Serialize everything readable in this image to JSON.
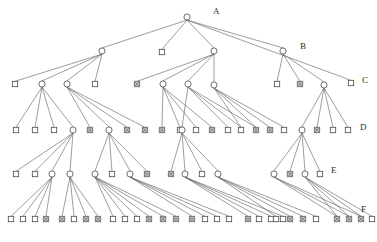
{
  "figure": {
    "caption": "",
    "level_labels": [
      {
        "text": "A",
        "x": 213,
        "y": 6
      },
      {
        "text": "B",
        "x": 300,
        "y": 41
      },
      {
        "text": "C",
        "x": 362,
        "y": 75
      },
      {
        "text": "D",
        "x": 360,
        "y": 122
      },
      {
        "text": "E",
        "x": 331,
        "y": 165
      },
      {
        "text": "F",
        "x": 361,
        "y": 204
      }
    ],
    "colors": {
      "edge": "#5d5d5d",
      "node_stroke": "#4a4a4a",
      "node_fill": "#ffffff",
      "marked_fill": "#8a8a8a",
      "text": "#2b2b2b",
      "background": "#ffffff"
    },
    "legend_note": "circle = internal node, square = leaf node, crossed square = marked leaf"
  },
  "chart_data": {
    "type": "diagram",
    "title": "",
    "rows": [
      "A",
      "B",
      "C",
      "D",
      "E",
      "F"
    ],
    "row_y": [
      17,
      51,
      84,
      130,
      174,
      219
    ],
    "nodes": [
      {
        "id": "A0",
        "row": 0,
        "x": 187,
        "y": 17,
        "shape": "circle",
        "marked": false
      },
      {
        "id": "B0",
        "row": 1,
        "x": 102,
        "y": 51,
        "shape": "circle",
        "marked": false
      },
      {
        "id": "B1",
        "row": 1,
        "x": 162,
        "y": 52,
        "shape": "square",
        "marked": false
      },
      {
        "id": "B2",
        "row": 1,
        "x": 214,
        "y": 51,
        "shape": "circle",
        "marked": false
      },
      {
        "id": "B3",
        "row": 1,
        "x": 283,
        "y": 51,
        "shape": "circle",
        "marked": false
      },
      {
        "id": "C0",
        "row": 2,
        "x": 15,
        "y": 84,
        "shape": "square",
        "marked": false
      },
      {
        "id": "C1",
        "row": 2,
        "x": 42,
        "y": 84,
        "shape": "circle",
        "marked": false
      },
      {
        "id": "C2",
        "row": 2,
        "x": 67,
        "y": 84,
        "shape": "circle",
        "marked": false
      },
      {
        "id": "C3",
        "row": 2,
        "x": 95,
        "y": 84,
        "shape": "square",
        "marked": false
      },
      {
        "id": "C4",
        "row": 2,
        "x": 137,
        "y": 84,
        "shape": "square",
        "marked": true
      },
      {
        "id": "C5",
        "row": 2,
        "x": 163,
        "y": 84,
        "shape": "circle",
        "marked": false
      },
      {
        "id": "C6",
        "row": 2,
        "x": 188,
        "y": 84,
        "shape": "circle",
        "marked": false
      },
      {
        "id": "C7",
        "row": 2,
        "x": 214,
        "y": 85,
        "shape": "circle",
        "marked": false
      },
      {
        "id": "C8",
        "row": 2,
        "x": 277,
        "y": 84,
        "shape": "square",
        "marked": false
      },
      {
        "id": "C9",
        "row": 2,
        "x": 300,
        "y": 84,
        "shape": "square",
        "marked": true
      },
      {
        "id": "C10",
        "row": 2,
        "x": 324,
        "y": 85,
        "shape": "circle",
        "marked": false
      },
      {
        "id": "C11",
        "row": 2,
        "x": 351,
        "y": 83,
        "shape": "square",
        "marked": false
      },
      {
        "id": "D0",
        "row": 3,
        "x": 16,
        "y": 130,
        "shape": "square",
        "marked": false
      },
      {
        "id": "D1",
        "row": 3,
        "x": 35,
        "y": 130,
        "shape": "square",
        "marked": false
      },
      {
        "id": "D2",
        "row": 3,
        "x": 54,
        "y": 130,
        "shape": "square",
        "marked": false
      },
      {
        "id": "D3",
        "row": 3,
        "x": 73,
        "y": 130,
        "shape": "circle",
        "marked": false
      },
      {
        "id": "D4",
        "row": 3,
        "x": 90,
        "y": 130,
        "shape": "square",
        "marked": true
      },
      {
        "id": "D5",
        "row": 3,
        "x": 109,
        "y": 130,
        "shape": "circle",
        "marked": false
      },
      {
        "id": "D6",
        "row": 3,
        "x": 127,
        "y": 130,
        "shape": "square",
        "marked": true
      },
      {
        "id": "D7",
        "row": 3,
        "x": 145,
        "y": 130,
        "shape": "square",
        "marked": true
      },
      {
        "id": "D8",
        "row": 3,
        "x": 162,
        "y": 130,
        "shape": "square",
        "marked": true
      },
      {
        "id": "D9",
        "row": 3,
        "x": 180,
        "y": 130,
        "shape": "square",
        "marked": false
      },
      {
        "id": "D10",
        "row": 3,
        "x": 196,
        "y": 130,
        "shape": "square",
        "marked": false
      },
      {
        "id": "D11",
        "row": 3,
        "x": 212,
        "y": 130,
        "shape": "square",
        "marked": true
      },
      {
        "id": "D12",
        "row": 3,
        "x": 182,
        "y": 130,
        "shape": "circle",
        "marked": false
      },
      {
        "id": "D13",
        "row": 3,
        "x": 228,
        "y": 130,
        "shape": "square",
        "marked": false
      },
      {
        "id": "D14",
        "row": 3,
        "x": 241,
        "y": 130,
        "shape": "square",
        "marked": false
      },
      {
        "id": "D15",
        "row": 3,
        "x": 256,
        "y": 130,
        "shape": "square",
        "marked": true
      },
      {
        "id": "D16",
        "row": 3,
        "x": 270,
        "y": 130,
        "shape": "square",
        "marked": true
      },
      {
        "id": "D17",
        "row": 3,
        "x": 284,
        "y": 130,
        "shape": "square",
        "marked": false
      },
      {
        "id": "D18",
        "row": 3,
        "x": 302,
        "y": 130,
        "shape": "circle",
        "marked": false
      },
      {
        "id": "D19",
        "row": 3,
        "x": 317,
        "y": 130,
        "shape": "square",
        "marked": true
      },
      {
        "id": "D20",
        "row": 3,
        "x": 333,
        "y": 130,
        "shape": "square",
        "marked": false
      },
      {
        "id": "D21",
        "row": 3,
        "x": 348,
        "y": 130,
        "shape": "square",
        "marked": false
      },
      {
        "id": "E0",
        "row": 4,
        "x": 16,
        "y": 174,
        "shape": "square",
        "marked": false
      },
      {
        "id": "E1",
        "row": 4,
        "x": 35,
        "y": 174,
        "shape": "square",
        "marked": false
      },
      {
        "id": "E2",
        "row": 4,
        "x": 52,
        "y": 174,
        "shape": "circle",
        "marked": false
      },
      {
        "id": "E3",
        "row": 4,
        "x": 70,
        "y": 174,
        "shape": "circle",
        "marked": false
      },
      {
        "id": "E4",
        "row": 4,
        "x": 95,
        "y": 174,
        "shape": "circle",
        "marked": false
      },
      {
        "id": "E5",
        "row": 4,
        "x": 112,
        "y": 174,
        "shape": "square",
        "marked": false
      },
      {
        "id": "E6",
        "row": 4,
        "x": 130,
        "y": 174,
        "shape": "circle",
        "marked": false
      },
      {
        "id": "E7",
        "row": 4,
        "x": 147,
        "y": 174,
        "shape": "square",
        "marked": true
      },
      {
        "id": "E8",
        "row": 4,
        "x": 171,
        "y": 174,
        "shape": "square",
        "marked": true
      },
      {
        "id": "E9",
        "row": 4,
        "x": 185,
        "y": 174,
        "shape": "circle",
        "marked": false
      },
      {
        "id": "E10",
        "row": 4,
        "x": 202,
        "y": 174,
        "shape": "square",
        "marked": false
      },
      {
        "id": "E11",
        "row": 4,
        "x": 218,
        "y": 174,
        "shape": "circle",
        "marked": false
      },
      {
        "id": "E12",
        "row": 4,
        "x": 274,
        "y": 174,
        "shape": "circle",
        "marked": false
      },
      {
        "id": "E13",
        "row": 4,
        "x": 290,
        "y": 174,
        "shape": "square",
        "marked": true
      },
      {
        "id": "E14",
        "row": 4,
        "x": 305,
        "y": 174,
        "shape": "circle",
        "marked": false
      },
      {
        "id": "E15",
        "row": 4,
        "x": 320,
        "y": 174,
        "shape": "square",
        "marked": false
      },
      {
        "id": "F0",
        "row": 5,
        "x": 11,
        "y": 219,
        "shape": "square",
        "marked": false
      },
      {
        "id": "F1",
        "row": 5,
        "x": 23,
        "y": 219,
        "shape": "square",
        "marked": false
      },
      {
        "id": "F2",
        "row": 5,
        "x": 35,
        "y": 219,
        "shape": "square",
        "marked": false
      },
      {
        "id": "F3",
        "row": 5,
        "x": 46,
        "y": 219,
        "shape": "square",
        "marked": true
      },
      {
        "id": "F4",
        "row": 5,
        "x": 62,
        "y": 219,
        "shape": "square",
        "marked": true
      },
      {
        "id": "F5",
        "row": 5,
        "x": 74,
        "y": 219,
        "shape": "square",
        "marked": false
      },
      {
        "id": "F6",
        "row": 5,
        "x": 86,
        "y": 219,
        "shape": "square",
        "marked": true
      },
      {
        "id": "F7",
        "row": 5,
        "x": 98,
        "y": 219,
        "shape": "square",
        "marked": true
      },
      {
        "id": "F8",
        "row": 5,
        "x": 113,
        "y": 219,
        "shape": "square",
        "marked": false
      },
      {
        "id": "F9",
        "row": 5,
        "x": 125,
        "y": 219,
        "shape": "square",
        "marked": false
      },
      {
        "id": "F10",
        "row": 5,
        "x": 137,
        "y": 219,
        "shape": "square",
        "marked": false
      },
      {
        "id": "F11",
        "row": 5,
        "x": 149,
        "y": 219,
        "shape": "square",
        "marked": true
      },
      {
        "id": "F12",
        "row": 5,
        "x": 163,
        "y": 219,
        "shape": "square",
        "marked": true
      },
      {
        "id": "F13",
        "row": 5,
        "x": 176,
        "y": 219,
        "shape": "square",
        "marked": true
      },
      {
        "id": "F14",
        "row": 5,
        "x": 192,
        "y": 219,
        "shape": "square",
        "marked": true
      },
      {
        "id": "F15",
        "row": 5,
        "x": 205,
        "y": 219,
        "shape": "square",
        "marked": false
      },
      {
        "id": "F16",
        "row": 5,
        "x": 217,
        "y": 219,
        "shape": "square",
        "marked": false
      },
      {
        "id": "F17",
        "row": 5,
        "x": 229,
        "y": 219,
        "shape": "square",
        "marked": false
      },
      {
        "id": "F18",
        "row": 5,
        "x": 248,
        "y": 219,
        "shape": "square",
        "marked": true
      },
      {
        "id": "F19",
        "row": 5,
        "x": 259,
        "y": 219,
        "shape": "square",
        "marked": false
      },
      {
        "id": "F20",
        "row": 5,
        "x": 271,
        "y": 219,
        "shape": "square",
        "marked": false
      },
      {
        "id": "F21",
        "row": 5,
        "x": 283,
        "y": 219,
        "shape": "square",
        "marked": false
      },
      {
        "id": "F22",
        "row": 5,
        "x": 276,
        "y": 219,
        "shape": "square",
        "marked": false
      },
      {
        "id": "F23",
        "row": 5,
        "x": 290,
        "y": 219,
        "shape": "square",
        "marked": true
      },
      {
        "id": "F24",
        "row": 5,
        "x": 303,
        "y": 219,
        "shape": "square",
        "marked": true
      },
      {
        "id": "F25",
        "row": 5,
        "x": 316,
        "y": 219,
        "shape": "square",
        "marked": false
      },
      {
        "id": "F26",
        "row": 5,
        "x": 337,
        "y": 219,
        "shape": "square",
        "marked": true
      },
      {
        "id": "F27",
        "row": 5,
        "x": 349,
        "y": 219,
        "shape": "square",
        "marked": true
      },
      {
        "id": "F28",
        "row": 5,
        "x": 361,
        "y": 219,
        "shape": "square",
        "marked": true
      },
      {
        "id": "F29",
        "row": 5,
        "x": 372,
        "y": 219,
        "shape": "square",
        "marked": false
      }
    ],
    "edges": [
      [
        "A0",
        "B0"
      ],
      [
        "A0",
        "B1"
      ],
      [
        "A0",
        "B2"
      ],
      [
        "A0",
        "B3"
      ],
      [
        "A0",
        "C11"
      ],
      [
        "B0",
        "C0"
      ],
      [
        "B0",
        "C1"
      ],
      [
        "B0",
        "C2"
      ],
      [
        "B0",
        "C3"
      ],
      [
        "B2",
        "C4"
      ],
      [
        "B2",
        "C5"
      ],
      [
        "B2",
        "C6"
      ],
      [
        "B2",
        "C7"
      ],
      [
        "B3",
        "C8"
      ],
      [
        "B3",
        "C9"
      ],
      [
        "B3",
        "C10"
      ],
      [
        "C1",
        "D0"
      ],
      [
        "C1",
        "D1"
      ],
      [
        "C1",
        "D2"
      ],
      [
        "C1",
        "D3"
      ],
      [
        "C2",
        "D4"
      ],
      [
        "C2",
        "D5"
      ],
      [
        "C2",
        "D6"
      ],
      [
        "C2",
        "D7"
      ],
      [
        "C5",
        "D8"
      ],
      [
        "C5",
        "D9"
      ],
      [
        "C5",
        "D10"
      ],
      [
        "C5",
        "D11"
      ],
      [
        "C6",
        "D12"
      ],
      [
        "C6",
        "D13"
      ],
      [
        "C6",
        "D14"
      ],
      [
        "C6",
        "D15"
      ],
      [
        "C7",
        "D16"
      ],
      [
        "C7",
        "D17"
      ],
      [
        "C7",
        "D14"
      ],
      [
        "C7",
        "D15"
      ],
      [
        "C10",
        "D18"
      ],
      [
        "C10",
        "D19"
      ],
      [
        "C10",
        "D20"
      ],
      [
        "C10",
        "D21"
      ],
      [
        "D3",
        "E0"
      ],
      [
        "D3",
        "E1"
      ],
      [
        "D3",
        "E2"
      ],
      [
        "D3",
        "E3"
      ],
      [
        "D5",
        "E4"
      ],
      [
        "D5",
        "E5"
      ],
      [
        "D5",
        "E6"
      ],
      [
        "D5",
        "E7"
      ],
      [
        "D12",
        "E8"
      ],
      [
        "D12",
        "E9"
      ],
      [
        "D12",
        "E10"
      ],
      [
        "D12",
        "E11"
      ],
      [
        "D18",
        "E12"
      ],
      [
        "D18",
        "E13"
      ],
      [
        "D18",
        "E14"
      ],
      [
        "D18",
        "E15"
      ],
      [
        "E2",
        "F0"
      ],
      [
        "E2",
        "F1"
      ],
      [
        "E2",
        "F2"
      ],
      [
        "E2",
        "F3"
      ],
      [
        "E3",
        "F4"
      ],
      [
        "E3",
        "F5"
      ],
      [
        "E3",
        "F6"
      ],
      [
        "E3",
        "F7"
      ],
      [
        "E4",
        "F8"
      ],
      [
        "E4",
        "F9"
      ],
      [
        "E4",
        "F10"
      ],
      [
        "E4",
        "F11"
      ],
      [
        "E4",
        "F12"
      ],
      [
        "E4",
        "F13"
      ],
      [
        "E6",
        "F14"
      ],
      [
        "E6",
        "F15"
      ],
      [
        "E6",
        "F16"
      ],
      [
        "E6",
        "F17"
      ],
      [
        "E9",
        "F18"
      ],
      [
        "E9",
        "F19"
      ],
      [
        "E9",
        "F20"
      ],
      [
        "E9",
        "F21"
      ],
      [
        "E11",
        "F22"
      ],
      [
        "E11",
        "F23"
      ],
      [
        "E11",
        "F24"
      ],
      [
        "E11",
        "F25"
      ],
      [
        "E12",
        "F26"
      ],
      [
        "E12",
        "F27"
      ],
      [
        "E12",
        "F28"
      ],
      [
        "E14",
        "F26"
      ],
      [
        "E14",
        "F27"
      ],
      [
        "E14",
        "F28"
      ],
      [
        "E14",
        "F29"
      ]
    ]
  }
}
